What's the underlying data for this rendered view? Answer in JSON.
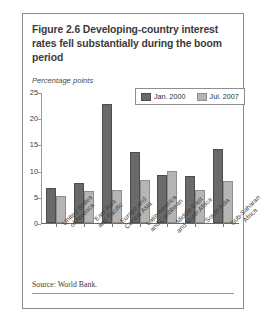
{
  "figure": {
    "title": "Figure 2.6  Developing-country interest rates fell substantially during the boom period",
    "source": "Source: World Bank."
  },
  "chart_data": {
    "type": "bar",
    "title": "Figure 2.6  Developing-country interest rates fell substantially during the boom period",
    "xlabel": "",
    "ylabel": "Percentage points",
    "ylim": [
      0,
      25
    ],
    "yticks": [
      0,
      5,
      10,
      15,
      20,
      25
    ],
    "grid": false,
    "legend_position": "top-right",
    "categories": [
      "United States\nof America",
      "East Asia\nand Pacific",
      "Europe and\nCentral Asia",
      "Latin America\nand Caribbean",
      "Middle East\nand North Africa",
      "South Asia",
      "Sub-Saharan\nAfrica"
    ],
    "series": [
      {
        "name": "Jan. 2000",
        "color": "#6a6a6a",
        "values": [
          6.8,
          7.6,
          22.9,
          13.7,
          9.3,
          9.0,
          14.2
        ]
      },
      {
        "name": "Jul. 2007",
        "color": "#b5b5b5",
        "values": [
          5.2,
          6.2,
          6.4,
          8.3,
          10.0,
          6.3,
          8.0
        ]
      }
    ]
  }
}
